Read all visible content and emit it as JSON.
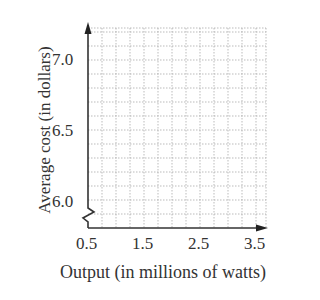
{
  "chart_data": {
    "type": "line",
    "title": "",
    "xlabel": "Output (in millions of watts)",
    "ylabel": "Average cost (in dollars)",
    "x_ticks": [
      "0.5",
      "1.5",
      "2.5",
      "3.5"
    ],
    "y_ticks": [
      "6.0",
      "6.5",
      "7.0"
    ],
    "xlim": [
      0.5,
      3.75
    ],
    "ylim": [
      5.85,
      7.2
    ],
    "grid": true,
    "y_axis_break": true,
    "series": []
  }
}
